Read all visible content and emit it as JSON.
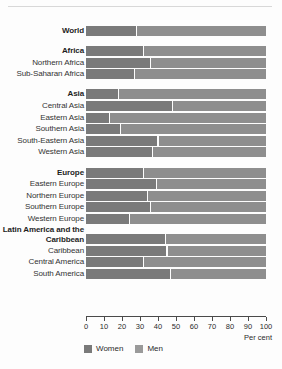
{
  "chart_data": {
    "type": "bar",
    "orientation": "horizontal",
    "stacked": true,
    "normalized": true,
    "title": "",
    "xlabel": "Per cent",
    "ylabel": "",
    "xlim": [
      0,
      100
    ],
    "xticks": [
      "0",
      "10",
      "20",
      "30",
      "40",
      "50",
      "60",
      "70",
      "80",
      "90",
      "100"
    ],
    "grid": false,
    "legend_position": "bottom-left",
    "series": [
      {
        "name": "Women",
        "color": "#7a7a7a"
      },
      {
        "name": "Men",
        "color": "#8e8e8e"
      }
    ],
    "categories": [
      "World",
      "Africa",
      "Northern Africa",
      "Sub-Saharan Africa",
      "Asia",
      "Central Asia",
      "Eastern Asia",
      "Southern Asia",
      "South-Eastern Asia",
      "Western Asia",
      "Europe",
      "Eastern Europe",
      "Northern Europe",
      "Southern Europe",
      "Western Europe",
      "Latin America and the Caribbean",
      "Caribbean",
      "Central America",
      "South America"
    ],
    "women_values": [
      28,
      32,
      36,
      27,
      18,
      48,
      13,
      19,
      40,
      37,
      32,
      39,
      34,
      36,
      24,
      44,
      45,
      32,
      47
    ],
    "men_values": [
      72,
      68,
      64,
      73,
      82,
      52,
      87,
      81,
      60,
      63,
      68,
      61,
      66,
      64,
      76,
      56,
      55,
      68,
      53
    ]
  },
  "rows": [
    {
      "label": "World",
      "major": true,
      "women": 28,
      "group_start": true
    },
    {
      "label": "Africa",
      "major": true,
      "women": 32,
      "group_start": true
    },
    {
      "label": "Northern Africa",
      "major": false,
      "women": 36,
      "group_start": false
    },
    {
      "label": "Sub-Saharan Africa",
      "major": false,
      "women": 27,
      "group_start": false
    },
    {
      "label": "Asia",
      "major": true,
      "women": 18,
      "group_start": true
    },
    {
      "label": "Central Asia",
      "major": false,
      "women": 48,
      "group_start": false
    },
    {
      "label": "Eastern Asia",
      "major": false,
      "women": 13,
      "group_start": false
    },
    {
      "label": "Southern Asia",
      "major": false,
      "women": 19,
      "group_start": false
    },
    {
      "label": "South-Eastern Asia",
      "major": false,
      "women": 40,
      "group_start": false
    },
    {
      "label": "Western Asia",
      "major": false,
      "women": 37,
      "group_start": false
    },
    {
      "label": "Europe",
      "major": true,
      "women": 32,
      "group_start": true
    },
    {
      "label": "Eastern Europe",
      "major": false,
      "women": 39,
      "group_start": false
    },
    {
      "label": "Northern Europe",
      "major": false,
      "women": 34,
      "group_start": false
    },
    {
      "label": "Southern Europe",
      "major": false,
      "women": 36,
      "group_start": false
    },
    {
      "label": "Western Europe",
      "major": false,
      "women": 24,
      "group_start": false
    },
    {
      "label": "Latin America and the Caribbean",
      "major": true,
      "women": 44,
      "group_start": true,
      "two_line": true
    },
    {
      "label": "Caribbean",
      "major": false,
      "women": 45,
      "group_start": false
    },
    {
      "label": "Central America",
      "major": false,
      "women": 32,
      "group_start": false
    },
    {
      "label": "South America",
      "major": false,
      "women": 47,
      "group_start": false
    }
  ],
  "axis": {
    "ticks": [
      "0",
      "10",
      "20",
      "30",
      "40",
      "50",
      "60",
      "70",
      "80",
      "90",
      "100"
    ],
    "unit_label": "Per cent"
  },
  "legend": {
    "items": [
      {
        "label": "Women",
        "color": "#7a7a7a"
      },
      {
        "label": "Men",
        "color": "#9a9a9a"
      }
    ]
  }
}
